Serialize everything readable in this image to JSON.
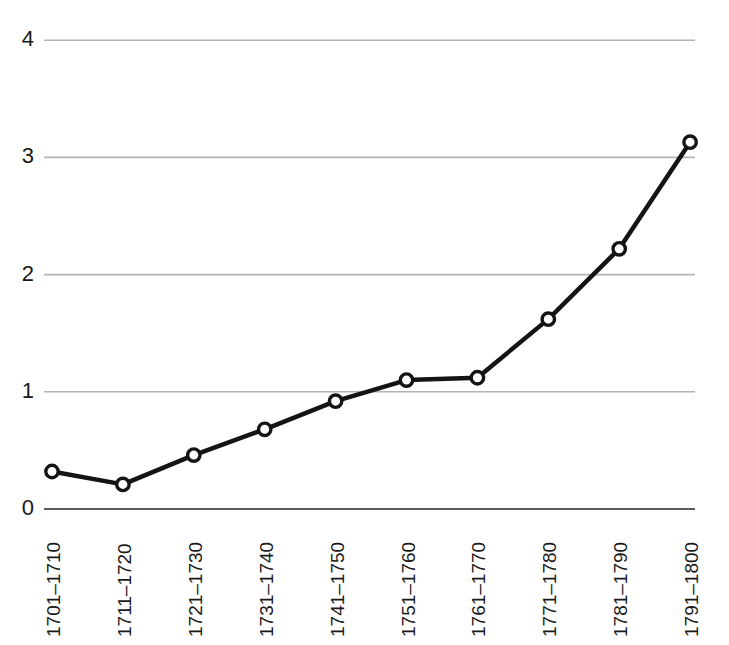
{
  "chart_data": {
    "type": "line",
    "title": "",
    "subtitle": "",
    "xlabel": "",
    "ylabel": "",
    "categories": [
      "1701–1710",
      "1711–1720",
      "1721–1730",
      "1731–1740",
      "1741–1750",
      "1751–1760",
      "1761–1770",
      "1771–1780",
      "1781–1790",
      "1791–1800"
    ],
    "values": [
      0.32,
      0.21,
      0.46,
      0.68,
      0.92,
      1.1,
      1.12,
      1.62,
      2.22,
      3.13
    ],
    "ylim": [
      0,
      4
    ],
    "ytick_labels": [
      "0",
      "1",
      "2",
      "3",
      "4"
    ],
    "ytick_values": [
      0,
      1,
      2,
      3,
      4
    ],
    "grid": true,
    "grid_axis": "y",
    "legend": false,
    "legend_position": "none",
    "marker": "open-circle",
    "line_color": "#141414",
    "marker_face_color": "#ffffff",
    "marker_edge_color": "#141414",
    "grid_color": "#b4b4b4",
    "axis_color": "#5a5a5a",
    "background_color": "#ffffff",
    "xtick_rotation": 90
  }
}
